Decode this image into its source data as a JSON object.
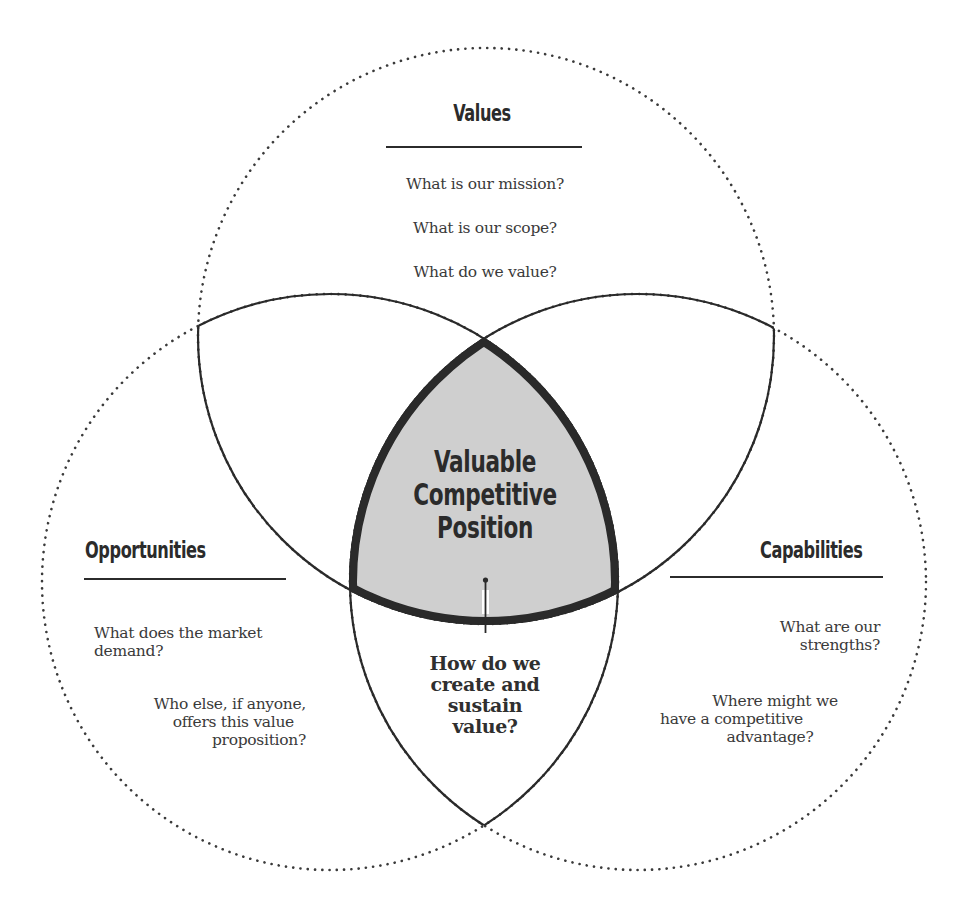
{
  "diagram": {
    "type": "venn-three-circle",
    "colors": {
      "outline": "#2a2a2a",
      "dotted_outline": "#3a3a3a",
      "center_fill": "#cfcfcf",
      "text": "#2b2b2b"
    },
    "center": {
      "title_lines": [
        "Valuable",
        "Competitive",
        "Position"
      ],
      "question_lines": [
        "How do we",
        "create and",
        "sustain",
        "value?"
      ]
    },
    "circles": {
      "values": {
        "heading": "Values",
        "questions": [
          "What is our mission?",
          "What is our scope?",
          "What do we value?"
        ]
      },
      "opportunities": {
        "heading": "Opportunities",
        "questions": [
          {
            "lines": [
              "What does the market",
              "demand?"
            ]
          },
          {
            "lines": [
              "Who else, if anyone,",
              "offers this value",
              "proposition?"
            ]
          }
        ]
      },
      "capabilities": {
        "heading": "Capabilities",
        "questions": [
          {
            "lines": [
              "What are our",
              "strengths?"
            ]
          },
          {
            "lines": [
              "Where might we",
              "have a competitive",
              "advantage?"
            ]
          }
        ]
      }
    }
  }
}
